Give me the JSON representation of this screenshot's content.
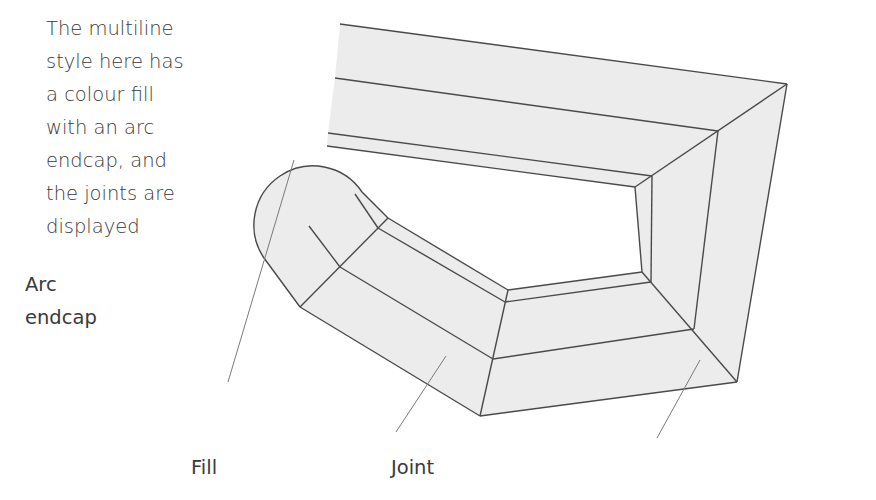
{
  "caption": {
    "lines": [
      "The multiline",
      "style here has",
      "a colour fill",
      "with an arc",
      "endcap, and",
      "the joints are",
      "displayed"
    ]
  },
  "labels": {
    "arc_endcap": [
      "Arc",
      "endcap"
    ],
    "fill": "Fill",
    "joint": "Joint"
  },
  "colors": {
    "fill": "#ececec",
    "edge": "#4a4a4a",
    "leader": "#7a7a7a",
    "text": "#3a3a3a",
    "background": "#ffffff"
  }
}
